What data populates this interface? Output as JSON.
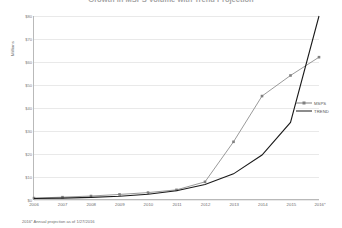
{
  "chart_data": {
    "type": "line",
    "title": "Growth in MSPS Volume with Trend Projection",
    "ylabel": "Millions",
    "xlabel": "",
    "categories": [
      "2006",
      "2007",
      "2008",
      "2009",
      "2010",
      "2011",
      "2012",
      "2013",
      "2014",
      "2015",
      "2016*"
    ],
    "yticks": [
      "$0",
      "$10",
      "$20",
      "$30",
      "$40",
      "$50",
      "$60",
      "$70",
      "$80"
    ],
    "ylim": [
      0,
      80
    ],
    "grid": true,
    "legend_position": "right",
    "series": [
      {
        "name": "MSPS",
        "color": "#808080",
        "marker": "square",
        "values": [
          0.4,
          0.8,
          1.3,
          2.0,
          2.8,
          4.0,
          7.5,
          25.0,
          45.0,
          54.0,
          62.0
        ]
      },
      {
        "name": "TREND",
        "color": "#1a1a1a",
        "marker": "none",
        "values": [
          0.2,
          0.4,
          0.7,
          1.2,
          2.1,
          3.6,
          6.3,
          11.0,
          19.2,
          33.5,
          80.0
        ]
      }
    ],
    "footnote": "2016* Annual projection as of 1/27/2016"
  },
  "legend": {
    "items": [
      {
        "label": "MSPS"
      },
      {
        "label": "TREND"
      }
    ]
  }
}
